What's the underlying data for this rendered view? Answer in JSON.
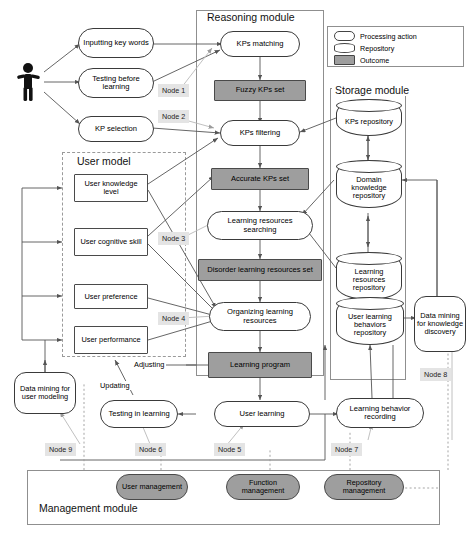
{
  "modules": {
    "reasoning": "Reasoning module",
    "storage": "Storage module",
    "user_model": "User model",
    "management": "Management module"
  },
  "legend": {
    "items": [
      {
        "symbol": "rounded-stadium",
        "label": "Processing action"
      },
      {
        "symbol": "cylinder",
        "label": "Repository"
      },
      {
        "symbol": "grey-rectangle",
        "label": "Outcome"
      }
    ]
  },
  "actor": {
    "icon": "person-icon",
    "label": "User"
  },
  "user_actions": [
    {
      "id": "inputting-key-words",
      "label": "Inputting key words"
    },
    {
      "id": "testing-before-learning",
      "label": "Testing before learning"
    },
    {
      "id": "kp-selection",
      "label": "KP selection"
    }
  ],
  "reasoning_chain": [
    {
      "id": "kps-matching",
      "label": "KPs matching",
      "kind": "processing action"
    },
    {
      "id": "fuzzy-kps-set",
      "label": "Fuzzy KPs set",
      "kind": "outcome"
    },
    {
      "id": "kps-filtering",
      "label": "KPs filtering",
      "kind": "processing action"
    },
    {
      "id": "accurate-kps-set",
      "label": "Accurate KPs set",
      "kind": "outcome"
    },
    {
      "id": "learning-resources-searching",
      "label": "Learning resources searching",
      "kind": "processing action"
    },
    {
      "id": "disorder-learning-resources-set",
      "label": "Disorder learning resources set",
      "kind": "outcome"
    },
    {
      "id": "organizing-learning-resources",
      "label": "Organizing learning resources",
      "kind": "processing action"
    },
    {
      "id": "learning-program",
      "label": "Learning program",
      "kind": "outcome"
    }
  ],
  "user_model_attributes": [
    {
      "id": "user-knowledge-level",
      "label": "User knowledge level"
    },
    {
      "id": "user-cognitive-skill",
      "label": "User cognitive skill"
    },
    {
      "id": "user-preference",
      "label": "User preference"
    },
    {
      "id": "user-performance",
      "label": "User performance"
    }
  ],
  "repositories": [
    {
      "id": "kps-repository",
      "label": "KPs repository"
    },
    {
      "id": "domain-knowledge-repository",
      "label": "Domain knowledge repository"
    },
    {
      "id": "learning-resources-repository",
      "label": "Learning resources repository"
    },
    {
      "id": "user-learning-behaviors-repository",
      "label": "User learning behaviors repository"
    }
  ],
  "bottom_processes": [
    {
      "id": "testing-in-learning",
      "label": "Testing in learning"
    },
    {
      "id": "user-learning",
      "label": "User learning"
    },
    {
      "id": "learning-behavior-recording",
      "label": "Learning behavior recording"
    }
  ],
  "data_mining": [
    {
      "id": "data-mining-for-user-modeling",
      "label": "Data mining for user modeling"
    },
    {
      "id": "data-mining-for-knowledge-discovery",
      "label": "Data mining for knowledge discovery"
    }
  ],
  "edge_labels": [
    {
      "id": "updating",
      "label": "Updating"
    },
    {
      "id": "adjusting",
      "label": "Adjusting"
    }
  ],
  "node_tags": [
    {
      "id": "node-1",
      "label": "Node 1"
    },
    {
      "id": "node-2",
      "label": "Node 2"
    },
    {
      "id": "node-3",
      "label": "Node 3"
    },
    {
      "id": "node-4",
      "label": "Node 4"
    },
    {
      "id": "node-5",
      "label": "Node 5"
    },
    {
      "id": "node-6",
      "label": "Node 6"
    },
    {
      "id": "node-7",
      "label": "Node 7"
    },
    {
      "id": "node-8",
      "label": "Node 8"
    },
    {
      "id": "node-9",
      "label": "Node 9"
    }
  ],
  "management_items": [
    {
      "id": "user-management",
      "label": "User management"
    },
    {
      "id": "function-management",
      "label": "Function management"
    },
    {
      "id": "repository-management",
      "label": "Repository management"
    }
  ],
  "colors": {
    "outcome_fill": "#9e9e9e",
    "management_fill": "#9e9e9e",
    "node_tag_fill": "#e4e4e4",
    "line": "#555555",
    "module_border": "#8f8f8f"
  }
}
